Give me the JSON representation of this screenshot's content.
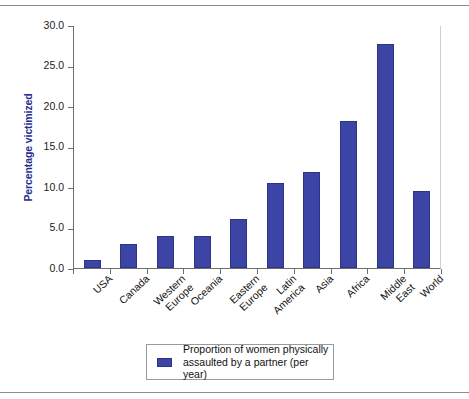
{
  "chart_data": {
    "type": "bar",
    "title": "",
    "xlabel": "",
    "ylabel": "Percentage victimized",
    "ylim": [
      0,
      30
    ],
    "ytick_labels": [
      "30.0",
      "25.0",
      "20.0",
      "15.0",
      "10.0",
      "5.0",
      "0.0"
    ],
    "ytick_values": [
      30,
      25,
      20,
      15,
      10,
      5,
      0
    ],
    "grid": false,
    "legend_position": "below-center",
    "categories": [
      "USA",
      "Canada",
      "Western Europe",
      "Oceania",
      "Eastern Europe",
      "Latin America",
      "Asia",
      "Africa",
      "Middle East",
      "World"
    ],
    "category_lines": [
      [
        "USA"
      ],
      [
        "Canada"
      ],
      [
        "Western",
        "Europe"
      ],
      [
        "Oceania"
      ],
      [
        "Eastern",
        "Europe"
      ],
      [
        "Latin",
        "America"
      ],
      [
        "Asia"
      ],
      [
        "Africa"
      ],
      [
        "Middle",
        "East"
      ],
      [
        "World"
      ]
    ],
    "values": [
      1.0,
      3.0,
      4.0,
      4.0,
      6.0,
      10.5,
      11.8,
      18.2,
      27.6,
      9.5
    ],
    "series": [
      {
        "name": "Proportion of women physically assaulted by a partner (per year)",
        "values": [
          1.0,
          3.0,
          4.0,
          4.0,
          6.0,
          10.5,
          11.8,
          18.2,
          27.6,
          9.5
        ]
      }
    ],
    "legend": [
      {
        "label_lines": [
          "Proportion of women physically",
          "assaulted by a partner (per year)"
        ],
        "color": "#3c45a5"
      }
    ],
    "colors": {
      "bar_fill": "#3c45a5",
      "bar_edge": "#2d3483",
      "axis": "#6e6e6e",
      "axis_title": "#262f8f",
      "tick_text": "#1b1b1b",
      "frame_rule": "#8d8d8d",
      "legend_border": "#9a9a9a",
      "background": "#ffffff"
    }
  }
}
